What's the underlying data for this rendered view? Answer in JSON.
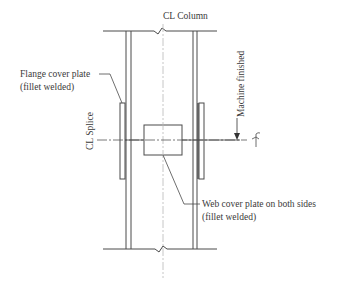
{
  "diagram": {
    "labels": {
      "cl_column": "CL Column",
      "cl_splice": "CL Splice",
      "flange_cover_line1": "Flange cover plate",
      "flange_cover_line2": "(fillet welded)",
      "machine_finished": "Machine finished",
      "web_cover_line1": "Web cover plate on both sides",
      "web_cover_line2": "(fillet welded)"
    },
    "colors": {
      "line": "#4a4a4a",
      "centerline": "#b8b8b8",
      "text": "#3a3a3a",
      "background": "#ffffff"
    }
  }
}
